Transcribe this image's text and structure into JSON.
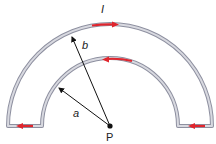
{
  "diagram": {
    "type": "physics-current-loop",
    "labels": {
      "current": "I",
      "outer_radius": "b",
      "inner_radius": "a",
      "point": "P"
    },
    "colors": {
      "wire": "#b9bbc4",
      "wire_edge": "#8e90a0",
      "arrow_current": "#e0262e",
      "radius_arrow": "#111111",
      "point": "#111111"
    },
    "geometry": {
      "center": [
        110,
        126
      ],
      "outer_radius_px": 102,
      "inner_radius_px": 68
    },
    "current_arrows": [
      {
        "segment": "outer-arc-top",
        "direction": "right"
      },
      {
        "segment": "inner-arc-top",
        "direction": "left"
      },
      {
        "segment": "bottom-left-connector",
        "direction": "left"
      },
      {
        "segment": "bottom-right-connector",
        "direction": "left"
      }
    ]
  }
}
